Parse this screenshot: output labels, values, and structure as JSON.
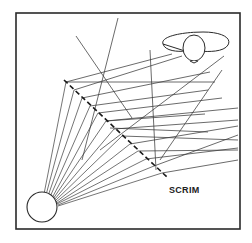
{
  "diagram": {
    "labels": {
      "scrim": "SCRIM"
    },
    "elements": {
      "light_source": "circle at lower left emitting a fan of rays",
      "scrim": "dashed diagonal line diffusing the rays",
      "observer": "eye symbol at upper right"
    },
    "colors": {
      "line": "#3a3a3a",
      "frame": "#2a2a2a",
      "background": "#ffffff"
    }
  }
}
